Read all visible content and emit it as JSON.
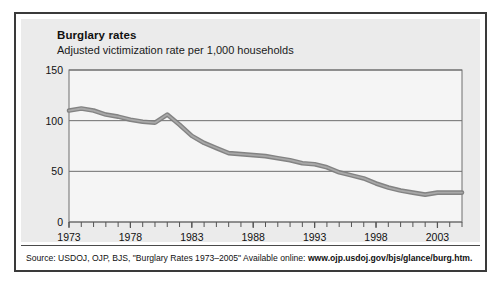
{
  "figure": {
    "title": "Burglary rates",
    "subtitle": "Adjusted victimization rate per 1,000 households",
    "source_prefix": "Source: USDOJ, OJP, BJS, \"Burglary Rates 1973–2005\" Available online: ",
    "source_url": "www.ojp.usdoj.gov/bjs/glance/burg.htm.",
    "colors": {
      "panel_background": "#ebebeb",
      "border": "#3a3a3a",
      "plot_background": "#f5f5f5",
      "axis": "#555555",
      "gridline": "#6e6e6e",
      "line": "#7c7c7c",
      "line_highlight": "#a8a8a8",
      "text": "#111111"
    }
  },
  "chart_data": {
    "type": "line",
    "title": "Burglary rates",
    "subtitle": "Adjusted victimization rate per 1,000 households",
    "xlabel": "",
    "ylabel": "Adjusted victimization rate per 1,000 households",
    "xlim": [
      1973,
      2005
    ],
    "ylim": [
      0,
      150
    ],
    "yticks": [
      0,
      50,
      100,
      150
    ],
    "ytick_labels": [
      "0",
      "50",
      "100",
      "150"
    ],
    "xticks": [
      1973,
      1978,
      1983,
      1988,
      1993,
      1998,
      2003
    ],
    "xtick_labels": [
      "1973",
      "1978",
      "1983",
      "1988",
      "1993",
      "1998",
      "2003"
    ],
    "x_minor_tick_step": 1,
    "grid": "horizontal",
    "legend": "none",
    "series": [
      {
        "name": "Adjusted burglary victimization rate per 1,000 households",
        "x": [
          1973,
          1974,
          1975,
          1976,
          1977,
          1978,
          1979,
          1980,
          1981,
          1982,
          1983,
          1984,
          1985,
          1986,
          1987,
          1988,
          1989,
          1990,
          1991,
          1992,
          1993,
          1994,
          1995,
          1996,
          1997,
          1998,
          1999,
          2000,
          2001,
          2002,
          2003,
          2004,
          2005
        ],
        "values": [
          110,
          112,
          110,
          106,
          104,
          101,
          99,
          98,
          106,
          96,
          85,
          78,
          73,
          68,
          67,
          66,
          65,
          63,
          61,
          58,
          57,
          54,
          49,
          46,
          43,
          38,
          34,
          31,
          29,
          27,
          29,
          29,
          29
        ]
      }
    ]
  }
}
